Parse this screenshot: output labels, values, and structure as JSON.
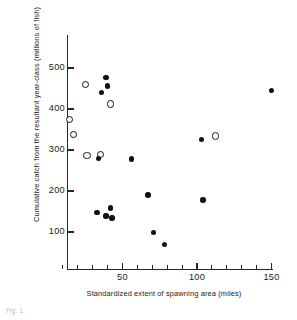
{
  "chart_data": {
    "type": "scatter",
    "title": "",
    "xlabel": "Standardized extent of spawning area (miles)",
    "ylabel": "Cumulative catch from the resultant year-class (millions of fish)",
    "xlim": [
      0,
      152
    ],
    "ylim": [
      40,
      560
    ],
    "grid": false,
    "legend_position": "none",
    "x_ticks": [
      50,
      100,
      150
    ],
    "x_tick_labels": [
      "50",
      "100",
      "150"
    ],
    "x_minor_ticks": [
      10,
      20,
      30,
      40,
      60,
      70,
      80,
      90,
      110,
      120,
      130,
      140
    ],
    "y_ticks": [
      100,
      200,
      300,
      400,
      500
    ],
    "y_tick_labels": [
      "100",
      "200",
      "300",
      "400",
      "500"
    ],
    "series": [
      {
        "name": "open-circles",
        "marker": "open-circle",
        "color": "#111111",
        "points": [
          {
            "x": 25,
            "y": 461
          },
          {
            "x": 42,
            "y": 413
          },
          {
            "x": 14,
            "y": 375
          },
          {
            "x": 17,
            "y": 338
          },
          {
            "x": 112,
            "y": 335
          },
          {
            "x": 26,
            "y": 288
          },
          {
            "x": 35,
            "y": 289
          }
        ]
      },
      {
        "name": "filled-circles",
        "marker": "filled-circle",
        "color": "#111111",
        "points": [
          {
            "x": 150,
            "y": 445
          },
          {
            "x": 39,
            "y": 477
          },
          {
            "x": 40,
            "y": 456
          },
          {
            "x": 36,
            "y": 441
          },
          {
            "x": 103,
            "y": 325
          },
          {
            "x": 34,
            "y": 279
          },
          {
            "x": 56,
            "y": 278
          },
          {
            "x": 67,
            "y": 190
          },
          {
            "x": 104,
            "y": 178
          },
          {
            "x": 42,
            "y": 159
          },
          {
            "x": 33,
            "y": 147
          },
          {
            "x": 39,
            "y": 139
          },
          {
            "x": 43,
            "y": 134
          },
          {
            "x": 71,
            "y": 99
          },
          {
            "x": 78,
            "y": 70
          }
        ]
      }
    ]
  },
  "caption": "Fig. 1."
}
